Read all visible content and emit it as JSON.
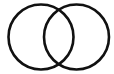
{
  "diagram": {
    "type": "venn",
    "background": "#ffffff",
    "stroke_color": "#111111",
    "stroke_width": 2.6,
    "circles": [
      {
        "name": "left-circle",
        "cx": 41,
        "cy": 37,
        "r": 32.5
      },
      {
        "name": "right-circle",
        "cx": 76.5,
        "cy": 37,
        "r": 32.5
      }
    ]
  }
}
